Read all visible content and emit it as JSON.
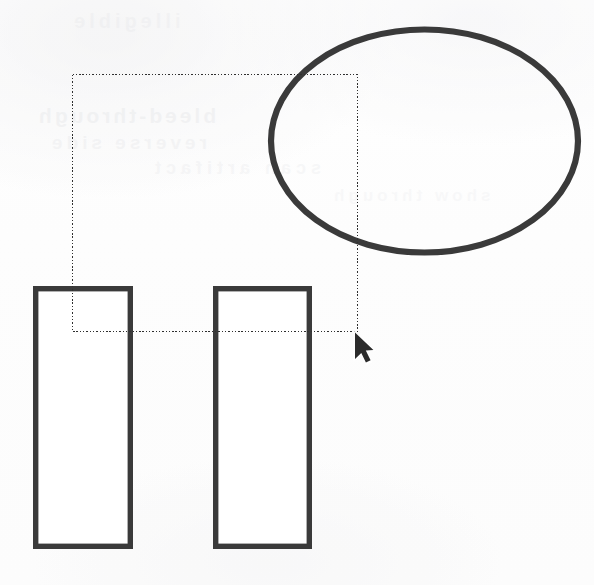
{
  "canvas": {
    "width": 594,
    "height": 585,
    "background_color": "#fdfdfd",
    "stroke_color": "#3a3a3a",
    "marquee_color": "#2f2f2f",
    "cursor_color": "#2b2b2b",
    "title": "Drawing Canvas"
  },
  "ghost_text": {
    "line_1": "bleed-through",
    "line_2": "reverse side",
    "line_3": "scan artifact",
    "line_4": "illegible",
    "line_5": "show through"
  },
  "shapes": [
    {
      "id": "ellipse-1",
      "type": "ellipse",
      "cx": 424.5,
      "cy": 141.0,
      "rx": 153.5,
      "ry": 111.5,
      "stroke_width": 6.2,
      "stroke": "#3a3a3a",
      "fill": "none"
    },
    {
      "id": "rect-left",
      "type": "rectangle",
      "x": 35.7,
      "y": 288.7,
      "width": 94.6,
      "height": 257.6,
      "stroke_width": 5.4,
      "stroke": "#3a3a3a",
      "fill": "#ffffff"
    },
    {
      "id": "rect-right",
      "type": "rectangle",
      "x": 215.7,
      "y": 288.7,
      "width": 93.6,
      "height": 257.6,
      "stroke_width": 5.4,
      "stroke": "#3a3a3a",
      "fill": "#ffffff"
    }
  ],
  "selection": {
    "id": "marquee-1",
    "type": "marquee-rectangle",
    "x": 72,
    "y": 74,
    "width": 286,
    "height": 258,
    "right": 358,
    "bottom": 332,
    "style": "dotted",
    "stroke_width": 1.35
  },
  "cursor": {
    "id": "mouse-pointer",
    "type": "arrow",
    "tip_x": 355,
    "tip_y": 332,
    "width": 18,
    "height": 28,
    "direction": "up-left"
  }
}
